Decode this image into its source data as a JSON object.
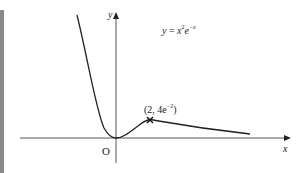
{
  "figure": {
    "equation": {
      "lhs": "y",
      "eq": " = ",
      "base1": "x",
      "exp1": "2",
      "base2": "e",
      "exp2": "−x"
    },
    "axes": {
      "x_label": "x",
      "y_label": "y",
      "origin_label": "O"
    },
    "point": {
      "open": "(2, 4e",
      "exp": "−2",
      "close": ")"
    },
    "colors": {
      "curve": "#222222",
      "axes": "#444444",
      "left_bar": "#8a8a8a"
    }
  }
}
